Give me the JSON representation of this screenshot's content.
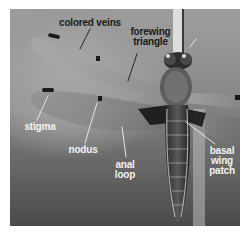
{
  "figure": {
    "labels": {
      "colored_veins": "colored veins",
      "forewing_triangle": "forewing\ntriangle",
      "stigma": "stigma",
      "nodus": "nodus",
      "anal_loop": "anal\nloop",
      "basal_wing_patch": "basal\nwing\npatch"
    }
  },
  "caption": {
    "text": ""
  }
}
